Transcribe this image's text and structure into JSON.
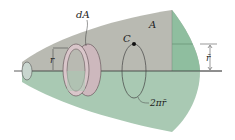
{
  "diagram": {
    "labels": {
      "area_element": "dA",
      "area": "A",
      "centroid": "C",
      "radius": "r",
      "centroid_radius": "r̄",
      "path_length": "2πr̄"
    },
    "colors": {
      "upper_surface": "#b9bab2",
      "lower_surface": "#a9c9b3",
      "right_band_upper": "#8fbe9f",
      "ring_fill": "#cdb8bd",
      "ring_stroke": "#6a5a5e",
      "line": "#333333"
    }
  }
}
